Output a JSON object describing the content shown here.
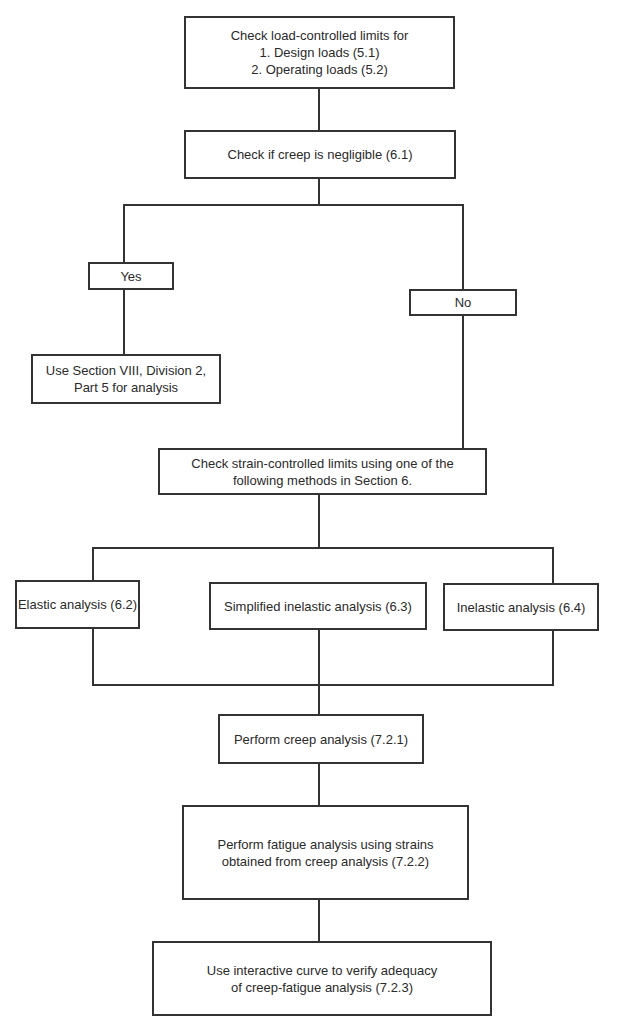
{
  "flowchart": {
    "load_limits": {
      "line1": "Check load-controlled limits for",
      "line2": "1. Design loads (5.1)",
      "line3": "2. Operating loads (5.2)"
    },
    "creep_check": "Check if creep is negligible (6.1)",
    "yes_label": "Yes",
    "no_label": "No",
    "section_viii": {
      "line1": "Use Section VIII, Division 2,",
      "line2": "Part 5 for analysis"
    },
    "strain_limits": {
      "line1": "Check strain-controlled limits using one of the",
      "line2": "following methods in Section 6."
    },
    "methods": [
      "Elastic analysis (6.2)",
      "Simplified inelastic analysis (6.3)",
      "Inelastic analysis (6.4)"
    ],
    "creep_analysis": "Perform creep analysis (7.2.1)",
    "fatigue_analysis": {
      "line1": "Perform fatigue analysis using strains",
      "line2": "obtained from creep analysis (7.2.2)"
    },
    "interactive_curve": {
      "line1": "Use interactive curve to verify adequacy",
      "line2": "of creep-fatigue analysis (7.2.3)"
    }
  }
}
